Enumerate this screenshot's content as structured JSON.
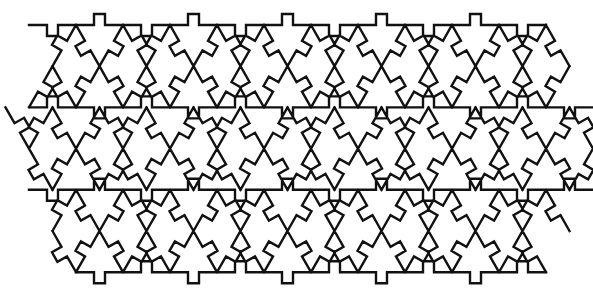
{
  "figure": {
    "background": "#ffffff",
    "stroke_color": "#111111",
    "width": 593,
    "height": 293
  },
  "lattice": {
    "side": 47,
    "row_height": 41.2,
    "origin_x": 123,
    "origin_y": 25,
    "tab_size": 11,
    "outline": [
      [
        52,
        25
      ],
      [
        568,
        25
      ],
      [
        585,
        107
      ],
      [
        585,
        190
      ],
      [
        543,
        272
      ],
      [
        75,
        272
      ],
      [
        8,
        148
      ],
      [
        52,
        25
      ]
    ]
  }
}
